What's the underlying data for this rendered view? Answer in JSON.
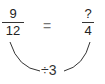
{
  "left_fraction": {
    "numerator": "9",
    "denominator": "12"
  },
  "relation": "=",
  "right_fraction": {
    "numerator": "?",
    "denominator": "4"
  },
  "operation": "÷3",
  "colors": {
    "text": "#222222",
    "arc": "#333333",
    "equals": "#777777"
  }
}
